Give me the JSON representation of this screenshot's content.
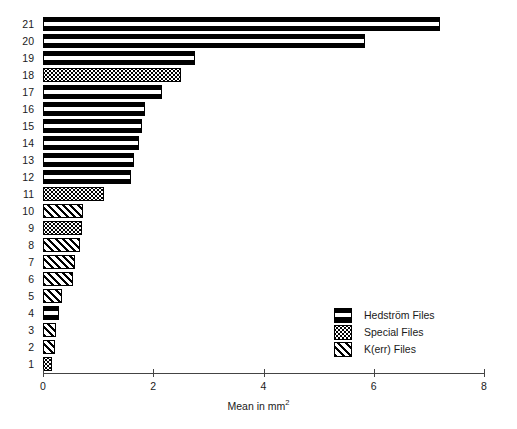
{
  "chart_data": {
    "type": "bar",
    "orientation": "horizontal",
    "title": "",
    "xlabel": "Mean in mm2",
    "xlabel_html": "Mean in mm<sup>2</sup>",
    "ylabel": "",
    "xlim": [
      0,
      8
    ],
    "xticks": [
      "0",
      "2",
      "4",
      "6",
      "8"
    ],
    "xtick_values": [
      0,
      2,
      4,
      6,
      8
    ],
    "grid": false,
    "legend_position": "lower-right",
    "categories": [
      "1",
      "2",
      "3",
      "4",
      "5",
      "6",
      "7",
      "8",
      "9",
      "10",
      "11",
      "12",
      "13",
      "14",
      "15",
      "16",
      "17",
      "18",
      "19",
      "20",
      "21"
    ],
    "bars": [
      {
        "category": "21",
        "value": 7.2,
        "group": "hedstrom"
      },
      {
        "category": "20",
        "value": 5.85,
        "group": "hedstrom"
      },
      {
        "category": "19",
        "value": 2.75,
        "group": "hedstrom"
      },
      {
        "category": "18",
        "value": 2.5,
        "group": "special"
      },
      {
        "category": "17",
        "value": 2.15,
        "group": "hedstrom"
      },
      {
        "category": "16",
        "value": 1.85,
        "group": "hedstrom"
      },
      {
        "category": "15",
        "value": 1.8,
        "group": "hedstrom"
      },
      {
        "category": "14",
        "value": 1.75,
        "group": "hedstrom"
      },
      {
        "category": "13",
        "value": 1.65,
        "group": "hedstrom"
      },
      {
        "category": "12",
        "value": 1.6,
        "group": "hedstrom"
      },
      {
        "category": "11",
        "value": 1.1,
        "group": "special"
      },
      {
        "category": "10",
        "value": 0.72,
        "group": "kerr"
      },
      {
        "category": "9",
        "value": 0.7,
        "group": "special"
      },
      {
        "category": "8",
        "value": 0.67,
        "group": "kerr"
      },
      {
        "category": "7",
        "value": 0.58,
        "group": "kerr"
      },
      {
        "category": "6",
        "value": 0.55,
        "group": "kerr"
      },
      {
        "category": "5",
        "value": 0.34,
        "group": "kerr"
      },
      {
        "category": "4",
        "value": 0.29,
        "group": "hedstrom"
      },
      {
        "category": "3",
        "value": 0.23,
        "group": "kerr"
      },
      {
        "category": "2",
        "value": 0.21,
        "group": "kerr"
      },
      {
        "category": "1",
        "value": 0.16,
        "group": "special"
      }
    ],
    "legend": [
      {
        "key": "hedstrom",
        "label": "Hedström Files",
        "pattern": "solid-black-with-white-band"
      },
      {
        "key": "special",
        "label": "Special Files",
        "pattern": "stipple-dots"
      },
      {
        "key": "kerr",
        "label": "K(err) Files",
        "pattern": "diagonal-hatch"
      }
    ],
    "colors": {
      "ink": "#000000",
      "background": "#ffffff",
      "axis": "#444444",
      "text": "#1a1a1a"
    }
  }
}
